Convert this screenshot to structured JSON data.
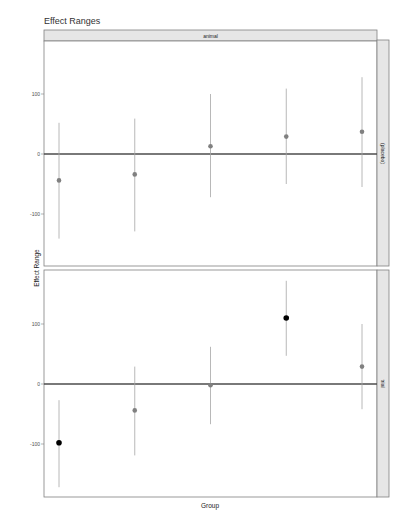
{
  "chart_data": {
    "type": "scatter",
    "subtype": "pointrange-facet",
    "title": "Effect Ranges",
    "xlabel": "Group",
    "ylabel": "Effect Range",
    "top_strip": "animal",
    "ylim": [
      -190,
      190
    ],
    "yticks": [
      -100,
      0,
      100
    ],
    "ytick_labels": [
      "-100",
      "0",
      "100"
    ],
    "reference_line": 0,
    "grid": false,
    "colors": {
      "point_default": "#808080",
      "point_highlight": "#000000",
      "range_line": "#a6a6a6",
      "reference_line": "#4d4d4d",
      "strip_fill": "#e6e6e6",
      "strip_border": "#808080"
    },
    "panels": [
      {
        "strip": "(placebo)",
        "points": [
          {
            "group": 1,
            "estimate": -44,
            "lower": -141,
            "upper": 52,
            "highlight": false
          },
          {
            "group": 2,
            "estimate": -34,
            "lower": -129,
            "upper": 59,
            "highlight": false
          },
          {
            "group": 3,
            "estimate": 13,
            "lower": -72,
            "upper": 100,
            "highlight": false
          },
          {
            "group": 4,
            "estimate": 29,
            "lower": -50,
            "upper": 109,
            "highlight": false
          },
          {
            "group": 5,
            "estimate": 37,
            "lower": -55,
            "upper": 128,
            "highlight": false
          }
        ]
      },
      {
        "strip": "trial",
        "points": [
          {
            "group": 1,
            "estimate": -98,
            "lower": -172,
            "upper": -27,
            "highlight": true
          },
          {
            "group": 2,
            "estimate": -44,
            "lower": -119,
            "upper": 29,
            "highlight": false
          },
          {
            "group": 3,
            "estimate": -2,
            "lower": -67,
            "upper": 62,
            "highlight": false
          },
          {
            "group": 4,
            "estimate": 110,
            "lower": 47,
            "upper": 172,
            "highlight": true
          },
          {
            "group": 5,
            "estimate": 29,
            "lower": -42,
            "upper": 100,
            "highlight": false
          }
        ]
      }
    ]
  }
}
